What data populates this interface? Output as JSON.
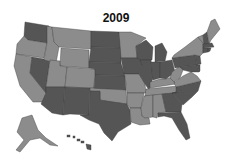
{
  "title": "2009",
  "legend": {
    "colors": {
      "dark": "#555555",
      "light": "#8c8c8c",
      "border": "#3a3a3a",
      "background": "#ffffff"
    }
  },
  "states": {
    "WA": "dark",
    "OR": "light",
    "CA": "light",
    "NV": "dark",
    "ID": "light",
    "MT": "light",
    "WY": "light",
    "UT": "light",
    "CO": "light",
    "AZ": "dark",
    "NM": "dark",
    "ND": "dark",
    "SD": "dark",
    "NE": "dark",
    "KS": "dark",
    "OK": "light",
    "TX": "dark",
    "MN": "light",
    "IA": "dark",
    "MO": "light",
    "AR": "light",
    "LA": "light",
    "WI": "dark",
    "IL": "dark",
    "MI": "dark",
    "IN": "dark",
    "OH": "dark",
    "KY": "light",
    "TN": "light",
    "MS": "light",
    "AL": "light",
    "GA": "dark",
    "FL": "dark",
    "SC": "dark",
    "NC": "dark",
    "VA": "light",
    "WV": "light",
    "PA": "dark",
    "NY": "light",
    "VT": "light",
    "NH": "dark",
    "ME": "light",
    "MA": "dark",
    "CT": "dark",
    "RI": "dark",
    "NJ": "dark",
    "DE": "dark",
    "MD": "dark",
    "AK": "light",
    "HI": "dark"
  }
}
